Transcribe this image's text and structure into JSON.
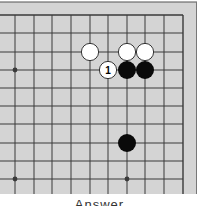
{
  "board": {
    "colors": {
      "background": "#d4d4d4",
      "line": "#3a3a3a",
      "border": "#555555",
      "black_stone": "#0a0a0a",
      "white_stone": "#ffffff",
      "white_stone_edge": "#222222"
    },
    "grid": {
      "x": [
        15,
        34,
        52,
        71,
        90,
        108,
        127,
        145,
        164,
        183
      ],
      "y": [
        15,
        33,
        52,
        70,
        88,
        106,
        124,
        143,
        161,
        179
      ]
    },
    "star_points": [
      {
        "col": 0,
        "row": 3
      },
      {
        "col": 0,
        "row": 9
      },
      {
        "col": 6,
        "row": 9
      }
    ],
    "stones": [
      {
        "color": "white",
        "col": 4,
        "row": 2,
        "label": ""
      },
      {
        "color": "white",
        "col": 6,
        "row": 2,
        "label": ""
      },
      {
        "color": "white",
        "col": 7,
        "row": 2,
        "label": ""
      },
      {
        "color": "white",
        "col": 5,
        "row": 3,
        "label": "1"
      },
      {
        "color": "black",
        "col": 6,
        "row": 3,
        "label": ""
      },
      {
        "color": "black",
        "col": 7,
        "row": 3,
        "label": ""
      },
      {
        "color": "black",
        "col": 6,
        "row": 7,
        "label": ""
      }
    ]
  },
  "caption": {
    "text": "Answer"
  }
}
